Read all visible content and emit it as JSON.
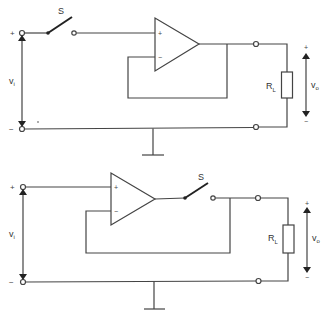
{
  "figure": {
    "type": "circuit-schematic",
    "line_color": "#444444",
    "background": "#ffffff"
  },
  "circuits": [
    {
      "id": "top",
      "switch_position": "input",
      "labels": {
        "switch": "S",
        "input_voltage": "v",
        "input_voltage_sub": "i",
        "output_voltage": "v",
        "output_voltage_sub": "o",
        "load_resistor": "R",
        "load_resistor_sub": "L",
        "input_plus": "+",
        "input_minus": "−",
        "output_plus": "+",
        "output_minus": "−",
        "opamp_noninverting": "+",
        "opamp_inverting": "−"
      }
    },
    {
      "id": "bottom",
      "switch_position": "output",
      "labels": {
        "switch": "S",
        "input_voltage": "v",
        "input_voltage_sub": "i",
        "output_voltage": "v",
        "output_voltage_sub": "o",
        "load_resistor": "R",
        "load_resistor_sub": "L",
        "input_plus": "+",
        "input_minus": "−",
        "output_plus": "+",
        "output_minus": "−",
        "opamp_noninverting": "+",
        "opamp_inverting": "−"
      }
    }
  ]
}
